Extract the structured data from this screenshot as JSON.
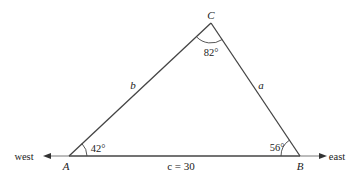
{
  "diagram": {
    "type": "triangle",
    "vertices": {
      "A": {
        "label": "A",
        "angle": "42°"
      },
      "B": {
        "label": "B",
        "angle": "56°"
      },
      "C": {
        "label": "C",
        "angle": "82°"
      }
    },
    "sides": {
      "a": {
        "label": "a"
      },
      "b": {
        "label": "b"
      },
      "c": {
        "label": "c = 30"
      }
    },
    "directions": {
      "west": "west",
      "east": "east"
    },
    "colors": {
      "line": "#333333",
      "text": "#222222"
    }
  }
}
